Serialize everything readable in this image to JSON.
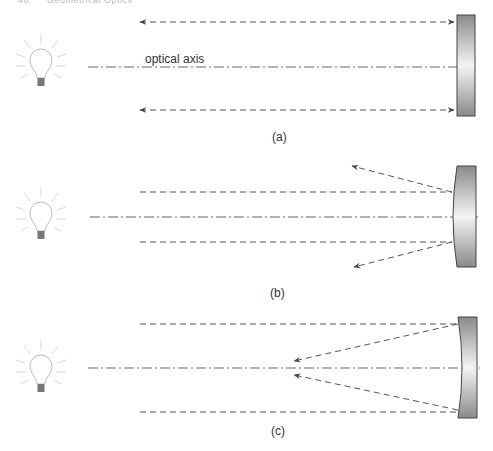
{
  "header": {
    "page_number": "46",
    "running_title": "Geometrical Optics"
  },
  "labels": {
    "optical_axis": "optical axis",
    "panel_a": "(a)",
    "panel_b": "(b)",
    "panel_c": "(c)"
  },
  "panels": [
    {
      "id": "a",
      "mirror_type": "plane mirror",
      "behavior": "rays reflect back parallel"
    },
    {
      "id": "b",
      "mirror_type": "convex mirror",
      "behavior": "rays diverge after reflection"
    },
    {
      "id": "c",
      "mirror_type": "concave mirror",
      "behavior": "rays converge toward focal point"
    }
  ],
  "colors": {
    "ray": "#555555",
    "axis": "#666666",
    "mirror_edge": "#444444",
    "mirror_dark": "#8a8a8a",
    "mirror_light": "#f2f2f2",
    "bulb": "#cccccc"
  }
}
